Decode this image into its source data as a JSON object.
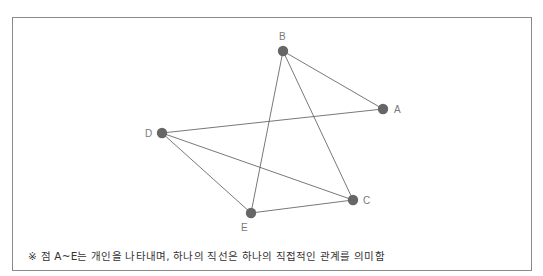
{
  "diagram": {
    "nodes": [
      {
        "id": "A",
        "label": "A",
        "x": 383,
        "y": 109,
        "label_dx": 11,
        "label_dy": 4
      },
      {
        "id": "B",
        "label": "B",
        "x": 283,
        "y": 51,
        "label_dx": -4,
        "label_dy": -11
      },
      {
        "id": "C",
        "label": "C",
        "x": 353,
        "y": 200,
        "label_dx": 10,
        "label_dy": 4
      },
      {
        "id": "D",
        "label": "D",
        "x": 162,
        "y": 133,
        "label_dx": -17,
        "label_dy": 4
      },
      {
        "id": "E",
        "label": "E",
        "x": 251,
        "y": 213,
        "label_dx": -10,
        "label_dy": 18
      }
    ],
    "edges": [
      [
        "B",
        "A"
      ],
      [
        "B",
        "E"
      ],
      [
        "B",
        "C"
      ],
      [
        "D",
        "A"
      ],
      [
        "D",
        "E"
      ],
      [
        "D",
        "C"
      ],
      [
        "E",
        "C"
      ]
    ],
    "node_color": "#666666",
    "edge_color": "#555555"
  },
  "note": "※ 점 A~E는 개인을 나타내며, 하나의 직선은 하나의 직접적인 관계를 의미함"
}
